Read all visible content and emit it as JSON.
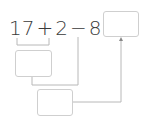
{
  "equation": {
    "tokens": [
      "17",
      "+",
      "2",
      "−",
      "8",
      "="
    ]
  },
  "boxes": {
    "answer": {
      "value": ""
    },
    "intermediate_1": {
      "value": ""
    },
    "intermediate_2": {
      "value": ""
    }
  },
  "colors": {
    "text": "#3a3a3a",
    "line": "#b8b8b8",
    "box_border": "#cfcfcf"
  }
}
